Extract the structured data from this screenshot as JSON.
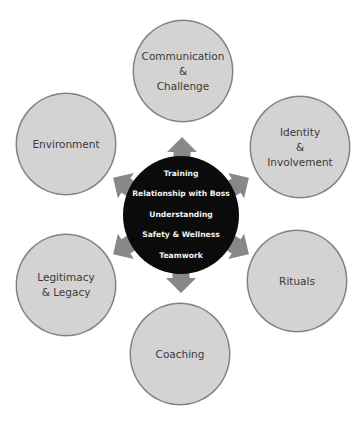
{
  "diagram": {
    "type": "hub-and-spoke",
    "hub": {
      "items": [
        "Training",
        "Relationship with Boss",
        "Understanding",
        "Safety & Wellness",
        "Teamwork"
      ]
    },
    "nodes": {
      "communication": {
        "lines": [
          "Communication",
          "&",
          "Challenge"
        ]
      },
      "identity": {
        "lines": [
          "Identity",
          "&",
          "Involvement"
        ]
      },
      "rituals": {
        "lines": [
          "Rituals"
        ]
      },
      "coaching": {
        "lines": [
          "Coaching"
        ]
      },
      "legitimacy": {
        "lines": [
          "Legitimacy",
          "& Legacy"
        ]
      },
      "environment": {
        "lines": [
          "Environment"
        ]
      }
    },
    "colors": {
      "hub_fill": "#0b0b0b",
      "hub_text": "#f2f2f2",
      "node_fill": "#d3d3d3",
      "node_border": "#7a7a7a",
      "node_text": "#3a3a3a",
      "arrow_fill": "#888888",
      "background": "#ffffff"
    }
  }
}
